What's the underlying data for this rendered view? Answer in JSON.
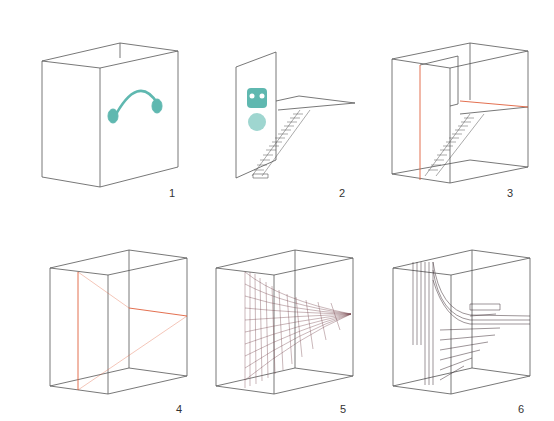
{
  "colors": {
    "line": "#555555",
    "accent": "#e0603c",
    "icon": "#5fb8b0",
    "mesh": "#7a4a50"
  },
  "panels": [
    {
      "label": "1",
      "desc": "box with headphones icon"
    },
    {
      "label": "2",
      "desc": "wall with gas mask icon and staircase"
    },
    {
      "label": "3",
      "desc": "box with staircase and landing"
    },
    {
      "label": "4",
      "desc": "box with red construction lines"
    },
    {
      "label": "5",
      "desc": "box with ruled mesh surface"
    },
    {
      "label": "6",
      "desc": "box with morphed staircase mesh"
    }
  ]
}
